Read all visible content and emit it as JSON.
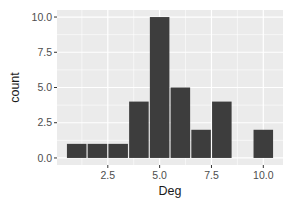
{
  "chart_data": {
    "type": "bar",
    "title": "",
    "xlabel": "Deg",
    "ylabel": "count",
    "bins": [
      {
        "center": 1,
        "count": 1
      },
      {
        "center": 2,
        "count": 1
      },
      {
        "center": 3,
        "count": 1
      },
      {
        "center": 4,
        "count": 4
      },
      {
        "center": 5,
        "count": 10
      },
      {
        "center": 6,
        "count": 5
      },
      {
        "center": 7,
        "count": 2
      },
      {
        "center": 8,
        "count": 4
      },
      {
        "center": 9,
        "count": 0
      },
      {
        "center": 10,
        "count": 2
      }
    ],
    "categories": [
      "1",
      "2",
      "3",
      "4",
      "5",
      "6",
      "7",
      "8",
      "9",
      "10"
    ],
    "values": [
      1,
      1,
      1,
      4,
      10,
      5,
      2,
      4,
      0,
      2
    ],
    "binwidth": 1,
    "xticks": [
      2.5,
      5.0,
      7.5,
      10.0
    ],
    "xtick_labels": [
      "2.5",
      "5.0",
      "7.5",
      "10.0"
    ],
    "yticks": [
      0.0,
      2.5,
      5.0,
      7.5,
      10.0
    ],
    "ytick_labels": [
      "0.0",
      "2.5",
      "5.0",
      "7.5",
      "10.0"
    ],
    "xlim": [
      0.05,
      10.95
    ],
    "ylim": [
      -0.5,
      10.5
    ],
    "grid": true,
    "legend": null,
    "colors": {
      "bar": "#3d3d3d",
      "panel": "#ebebeb",
      "grid": "#ffffff"
    }
  }
}
